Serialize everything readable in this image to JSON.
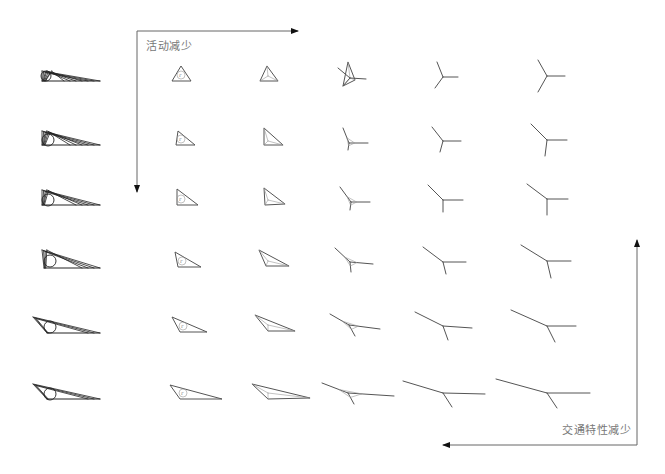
{
  "labels": {
    "activity_decrease": "活动减少",
    "traffic_decrease": "交通特性减少"
  },
  "colors": {
    "stroke": "#555555",
    "stroke_dark": "#222222",
    "arrow": "#666666",
    "text": "#777777",
    "background": "#ffffff"
  },
  "axes": {
    "top_left": {
      "horizontal": {
        "x1": 137,
        "y1": 31,
        "x2": 298,
        "y2": 31,
        "direction": "right"
      },
      "vertical": {
        "x1": 137,
        "y1": 31,
        "x2": 137,
        "y2": 192,
        "direction": "down"
      },
      "label_pos": {
        "x": 146,
        "y": 37
      }
    },
    "bottom_right": {
      "vertical": {
        "x1": 637,
        "y1": 445,
        "x2": 637,
        "y2": 240,
        "direction": "up"
      },
      "horizontal": {
        "x1": 637,
        "y1": 445,
        "x2": 443,
        "y2": 445,
        "direction": "left"
      },
      "label_pos": {
        "x": 562,
        "y": 421
      }
    }
  },
  "grid": {
    "rows": 6,
    "columns": 6,
    "description": "Transition of network forms from triangle (with inscribed circle) to Y-junction (Steiner point) as activity and traffic characteristics decrease",
    "shapes": [
      [
        {
          "type": "fan",
          "apex": [
            42,
            72
          ],
          "base": [
            38,
            81,
            100,
            81
          ],
          "circle": [
            46,
            76,
            5
          ]
        },
        {
          "type": "triangle",
          "pts": [
            [
              181,
              66
            ],
            [
              172,
              81
            ],
            [
              191,
              81
            ]
          ],
          "circle": [
            181,
            75,
            4
          ],
          "label": "r"
        },
        {
          "type": "tri-y",
          "pts": [
            [
              267,
              66
            ],
            [
              260,
              81
            ],
            [
              278,
              81
            ]
          ],
          "center": [
            268,
            76
          ]
        },
        {
          "type": "tri-y",
          "pts": [
            [
              348,
              62
            ],
            [
              343,
              86
            ],
            [
              355,
              80
            ]
          ],
          "center": [
            350,
            78
          ],
          "arms": [
            [
              338,
              68,
              350,
              78
            ],
            [
              350,
              78,
              366,
              79
            ],
            [
              350,
              78,
              343,
              86
            ]
          ]
        },
        {
          "type": "y",
          "center": [
            443,
            77
          ],
          "arms": [
            [
              437,
              62
            ],
            [
              458,
              77
            ],
            [
              435,
              88
            ]
          ]
        },
        {
          "type": "y",
          "center": [
            547,
            76
          ],
          "arms": [
            [
              538,
              60
            ],
            [
              565,
              76
            ],
            [
              538,
              92
            ]
          ]
        }
      ],
      [
        {
          "type": "fan",
          "apex": [
            42,
            132
          ],
          "base": [
            38,
            145,
            100,
            145
          ],
          "circle": [
            48,
            140,
            6
          ]
        },
        {
          "type": "triangle",
          "pts": [
            [
              178,
              131
            ],
            [
              176,
              145
            ],
            [
              195,
              145
            ]
          ],
          "circle": [
            181,
            139,
            4
          ],
          "label": "r"
        },
        {
          "type": "tri-y",
          "pts": [
            [
              264,
              128
            ],
            [
              264,
              145
            ],
            [
              283,
              145
            ]
          ],
          "center": [
            268,
            141
          ]
        },
        {
          "type": "y-tri",
          "center": [
            349,
            143
          ],
          "arms": [
            [
              343,
              128
            ],
            [
              368,
              143
            ],
            [
              348,
              150
            ]
          ]
        },
        {
          "type": "y",
          "center": [
            443,
            141
          ],
          "arms": [
            [
              432,
              127
            ],
            [
              461,
              141
            ],
            [
              440,
              152
            ]
          ]
        },
        {
          "type": "y",
          "center": [
            547,
            140
          ],
          "arms": [
            [
              531,
              124
            ],
            [
              567,
              140
            ],
            [
              545,
              156
            ]
          ]
        }
      ],
      [
        {
          "type": "fan",
          "apex": [
            42,
            191
          ],
          "base": [
            38,
            205,
            100,
            205
          ],
          "circle": [
            48,
            200,
            6
          ]
        },
        {
          "type": "triangle",
          "pts": [
            [
              177,
              189
            ],
            [
              177,
              205
            ],
            [
              198,
              205
            ]
          ],
          "circle": [
            181,
            199,
            4
          ],
          "label": "r"
        },
        {
          "type": "tri-y",
          "pts": [
            [
              264,
              188
            ],
            [
              265,
              205
            ],
            [
              285,
              204
            ]
          ],
          "center": [
            268,
            200
          ]
        },
        {
          "type": "y-tri",
          "center": [
            351,
            202
          ],
          "arms": [
            [
              340,
              187
            ],
            [
              370,
              202
            ],
            [
              350,
              210
            ]
          ]
        },
        {
          "type": "y",
          "center": [
            443,
            200
          ],
          "arms": [
            [
              428,
              185
            ],
            [
              463,
              200
            ],
            [
              443,
              212
            ]
          ]
        },
        {
          "type": "y",
          "center": [
            547,
            199
          ],
          "arms": [
            [
              527,
              184
            ],
            [
              568,
              199
            ],
            [
              547,
              215
            ]
          ]
        }
      ],
      [
        {
          "type": "fan",
          "apex": [
            42,
            251
          ],
          "base": [
            40,
            268,
            100,
            268
          ],
          "circle": [
            50,
            261,
            6
          ]
        },
        {
          "type": "triangle",
          "pts": [
            [
              175,
              252
            ],
            [
              178,
              267
            ],
            [
              201,
              267
            ]
          ],
          "circle": [
            182,
            261,
            4
          ],
          "label": "r"
        },
        {
          "type": "tri-y",
          "pts": [
            [
              259,
              250
            ],
            [
              266,
              266
            ],
            [
              289,
              266
            ]
          ],
          "center": [
            268,
            261
          ]
        },
        {
          "type": "y-tri",
          "center": [
            350,
            262
          ],
          "arms": [
            [
              335,
              248
            ],
            [
              373,
              264
            ],
            [
              351,
              272
            ]
          ]
        },
        {
          "type": "y",
          "center": [
            443,
            262
          ],
          "arms": [
            [
              423,
              247
            ],
            [
              466,
              262
            ],
            [
              446,
              274
            ]
          ]
        },
        {
          "type": "y",
          "center": [
            547,
            261
          ],
          "arms": [
            [
              521,
              245
            ],
            [
              571,
              261
            ],
            [
              551,
              278
            ]
          ]
        }
      ],
      [
        {
          "type": "fan",
          "apex": [
            33,
            318
          ],
          "base": [
            43,
            333,
            100,
            333
          ],
          "circle": [
            50,
            327,
            6
          ]
        },
        {
          "type": "triangle",
          "pts": [
            [
              172,
              317
            ],
            [
              180,
              332
            ],
            [
              207,
              332
            ]
          ],
          "circle": [
            183,
            326,
            4
          ],
          "label": "r"
        },
        {
          "type": "tri-y",
          "pts": [
            [
              255,
              315
            ],
            [
              268,
              331
            ],
            [
              295,
              331
            ]
          ],
          "center": [
            268,
            325
          ]
        },
        {
          "type": "y-tri",
          "center": [
            349,
            325
          ],
          "arms": [
            [
              330,
              314
            ],
            [
              380,
              329
            ],
            [
              355,
              336
            ]
          ]
        },
        {
          "type": "y",
          "center": [
            443,
            326
          ],
          "arms": [
            [
              415,
              312
            ],
            [
              472,
              328
            ],
            [
              448,
              340
            ]
          ]
        },
        {
          "type": "y",
          "center": [
            547,
            326
          ],
          "arms": [
            [
              511,
              310
            ],
            [
              576,
              326
            ],
            [
              555,
              342
            ]
          ]
        }
      ],
      [
        {
          "type": "fan",
          "apex": [
            33,
            385
          ],
          "base": [
            43,
            399,
            100,
            399
          ],
          "circle": [
            50,
            394,
            6
          ]
        },
        {
          "type": "triangle",
          "pts": [
            [
              170,
              385
            ],
            [
              180,
              399
            ],
            [
              222,
              399
            ]
          ],
          "circle": [
            183,
            393,
            4
          ],
          "label": "r"
        },
        {
          "type": "tri-y",
          "pts": [
            [
              252,
              384
            ],
            [
              268,
              399
            ],
            [
              310,
              398
            ]
          ],
          "center": [
            268,
            393
          ]
        },
        {
          "type": "y-tri",
          "center": [
            348,
            393
          ],
          "arms": [
            [
              322,
              383
            ],
            [
              394,
              396
            ],
            [
              354,
              404
            ]
          ]
        },
        {
          "type": "y",
          "center": [
            443,
            393
          ],
          "arms": [
            [
              403,
              381
            ],
            [
              485,
              394
            ],
            [
              452,
              407
            ]
          ]
        },
        {
          "type": "y",
          "center": [
            547,
            393
          ],
          "arms": [
            [
              496,
              379
            ],
            [
              590,
              393
            ],
            [
              557,
              408
            ]
          ]
        }
      ]
    ]
  }
}
